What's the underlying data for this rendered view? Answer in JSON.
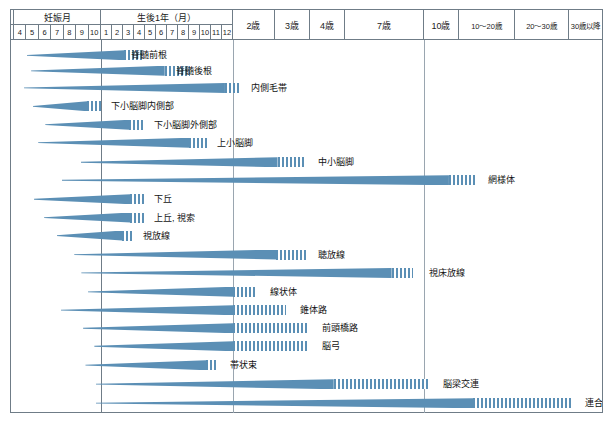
{
  "header": {
    "groups": [
      {
        "label": "妊娠月",
        "span_start": 0,
        "span_cols": 7
      },
      {
        "label": "生後1年（月）",
        "span_start": 7,
        "span_cols": 12
      },
      {
        "label": "2歳",
        "single": true
      },
      {
        "label": "3歳",
        "single": true
      },
      {
        "label": "4歳",
        "single": true
      },
      {
        "label": "7歳",
        "single": true
      },
      {
        "label": "10歳",
        "single": true
      },
      {
        "label": "10～20歳",
        "single": true
      },
      {
        "label": "20～30歳",
        "single": true
      },
      {
        "label": "30歳以降",
        "single": true
      }
    ],
    "gestation_months": [
      "4",
      "5",
      "6",
      "7",
      "8",
      "9",
      "10"
    ],
    "postnatal_months": [
      "1",
      "2",
      "3",
      "4",
      "5",
      "6",
      "7",
      "8",
      "9",
      "10",
      "11",
      "12"
    ],
    "age_labels": [
      "2歳",
      "3歳",
      "4歳",
      "7歳",
      "10歳",
      "10～20歳",
      "20～30歳",
      "30歳以降"
    ]
  },
  "colors": {
    "bar": "#5b8fb5",
    "grid": "#9aa6b0",
    "frame": "#6f7c87",
    "text": "#111111",
    "background": "#ffffff"
  },
  "chart_data": {
    "type": "bar",
    "xlabel": "年齢",
    "ylabel": "",
    "grid": true,
    "legend": "none",
    "axis_note": "横軸は非線形（妊娠4か月〜30歳以降）",
    "x_axis_ticks": [
      "4",
      "5",
      "6",
      "7",
      "8",
      "9",
      "10",
      "1",
      "2",
      "3",
      "4",
      "5",
      "6",
      "7",
      "8",
      "9",
      "10",
      "11",
      "12",
      "2歳",
      "3歳",
      "4歳",
      "7歳",
      "10歳",
      "10～20歳",
      "20～30歳",
      "30歳以降"
    ],
    "categories": [
      "脊髄前根",
      "脊髄後根",
      "内側毛帯",
      "下小脳脚内側部",
      "下小脳脚外側部",
      "上小脳脚",
      "中小脳脚",
      "網様体",
      "下丘",
      "上丘, 視索",
      "視放線",
      "聴放線",
      "視床放線",
      "線状体",
      "錐体路",
      "前頭橋路",
      "脳弓",
      "帯状束",
      "脳梁交連",
      "連合野"
    ],
    "series": [
      {
        "name": "髄鞘化開始〜完了（濃色）＋継続（縞）",
        "unit": "相対位置（0-100）"
      }
    ],
    "bars": [
      {
        "label": "脊髄前根",
        "label_x": 19.6,
        "start": 2.7,
        "solid_end": 19.2,
        "hatch_end": 22.5,
        "row_y": 3.0,
        "taper": 1.0
      },
      {
        "label": "脊髄後根",
        "label_x": 27.2,
        "start": 3.4,
        "solid_end": 26.0,
        "hatch_end": 30.3,
        "row_y": 8.0,
        "taper": 1.0
      },
      {
        "label": "内側毛帯",
        "label_x": 40.0,
        "start": 2.2,
        "solid_end": 36.2,
        "hatch_end": 38.9,
        "row_y": 13.5,
        "taper": 1.0
      },
      {
        "label": "下小脳脚内側部",
        "label_x": 16.3,
        "start": 3.7,
        "solid_end": 12.9,
        "hatch_end": 15.3,
        "row_y": 19.4,
        "taper": 1.0
      },
      {
        "label": "下小脳脚外側部",
        "label_x": 23.5,
        "start": 5.8,
        "solid_end": 20.0,
        "hatch_end": 22.7,
        "row_y": 25.3,
        "taper": 1.0
      },
      {
        "label": "上小脳脚",
        "label_x": 34.2,
        "start": 4.6,
        "solid_end": 30.2,
        "hatch_end": 33.1,
        "row_y": 31.1,
        "taper": 1.0
      },
      {
        "label": "中小脳脚",
        "label_x": 51.2,
        "start": 11.8,
        "solid_end": 45.1,
        "hatch_end": 50.0,
        "row_y": 37.4,
        "taper": 1.0
      },
      {
        "label": "網様体",
        "label_x": 80.0,
        "start": 8.6,
        "solid_end": 74.1,
        "hatch_end": 78.6,
        "row_y": 43.2,
        "taper": 1.0
      },
      {
        "label": "下丘",
        "label_x": 23.5,
        "start": 3.9,
        "solid_end": 20.2,
        "hatch_end": 22.5,
        "row_y": 49.3,
        "taper": 1.0
      },
      {
        "label": "上丘, 視索",
        "label_x": 23.5,
        "start": 5.6,
        "solid_end": 20.2,
        "hatch_end": 22.5,
        "row_y": 55.2,
        "taper": 1.0
      },
      {
        "label": "視放線",
        "label_x": 21.7,
        "start": 7.7,
        "solid_end": 18.8,
        "hatch_end": 20.5,
        "row_y": 61.0,
        "taper": 1.0
      },
      {
        "label": "聴放線",
        "label_x": 51.2,
        "start": 10.7,
        "solid_end": 44.9,
        "hatch_end": 50.0,
        "row_y": 67.1,
        "taper": 1.0
      },
      {
        "label": "視床放線",
        "label_x": 70.0,
        "start": 11.9,
        "solid_end": 64.4,
        "hatch_end": 68.0,
        "row_y": 73.0,
        "taper": 1.0
      },
      {
        "label": "線状体",
        "label_x": 43.1,
        "start": 13.0,
        "solid_end": 37.6,
        "hatch_end": 41.6,
        "row_y": 79.1,
        "taper": 1.0
      },
      {
        "label": "錐体路",
        "label_x": 48.2,
        "start": 8.4,
        "solid_end": 37.6,
        "hatch_end": 46.5,
        "row_y": 85.0,
        "taper": 1.0
      },
      {
        "label": "前頭橋路",
        "label_x": 52.0,
        "start": 12.2,
        "solid_end": 37.6,
        "hatch_end": 50.4,
        "row_y": 90.8,
        "taper": 1.0
      },
      {
        "label": "脳弓",
        "label_x": 52.0,
        "start": 14.1,
        "solid_end": 37.6,
        "hatch_end": 50.4,
        "row_y": 96.6,
        "taper": 1.0
      },
      {
        "label": "帯状束",
        "label_x": 36.4,
        "start": 12.6,
        "solid_end": 33.0,
        "hatch_end": 35.1,
        "row_y": 102.7,
        "taper": 1.0
      },
      {
        "label": "脳梁交連",
        "label_x": 72.5,
        "start": 14.3,
        "solid_end": 54.6,
        "hatch_end": 70.7,
        "row_y": 108.8,
        "taper": 1.0
      },
      {
        "label": "連合野",
        "label_x": 96.5,
        "start": 14.3,
        "solid_end": 78.2,
        "hatch_end": 95.0,
        "row_y": 114.9,
        "taper": 1.0
      }
    ]
  }
}
